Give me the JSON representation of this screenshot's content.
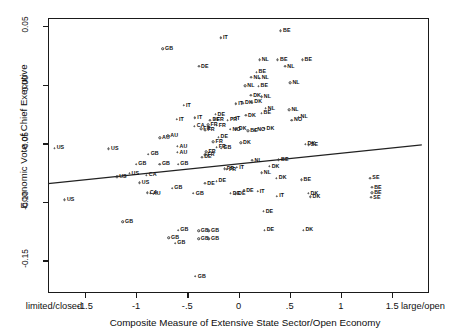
{
  "figure": {
    "kind": "scatter-plot",
    "background": "#ffffff",
    "foreground": "#111111"
  },
  "chart_data": {
    "type": "scatter",
    "title": "",
    "xlabel": "Composite Measure of Extensive State Sector/Open Economy",
    "ylabel": "Economic Vote of Chief Executive",
    "xlim": [
      -1.86,
      1.86
    ],
    "ylim": [
      -0.178,
      0.057
    ],
    "grid": false,
    "legend": null,
    "x_ticks": [
      {
        "value": -1.86,
        "label": "limited/closed",
        "anchor_shift": 6
      },
      {
        "value": -1.5,
        "label": "-1.5"
      },
      {
        "value": -1.0,
        "label": "-1"
      },
      {
        "value": -0.5,
        "label": "-.5"
      },
      {
        "value": 0.0,
        "label": "0"
      },
      {
        "value": 0.5,
        "label": ".5"
      },
      {
        "value": 1.0,
        "label": "1"
      },
      {
        "value": 1.5,
        "label": "1.5"
      },
      {
        "value": 1.86,
        "label": "large/open",
        "anchor_shift": -6
      }
    ],
    "y_ticks": [
      {
        "value": 0.05,
        "label": "0.05"
      },
      {
        "value": 0.0,
        "label": "0.00"
      },
      {
        "value": -0.05,
        "label": "-0.05"
      },
      {
        "value": -0.1,
        "label": "-0.10"
      },
      {
        "value": -0.15,
        "label": "-0.15"
      }
    ],
    "fit_line": {
      "label": "regression-line",
      "x_start": -1.86,
      "y_start": -0.0845,
      "x_end": 1.79,
      "y_end": -0.0515,
      "color": "#222222"
    },
    "point_label_key": "country code",
    "points": [
      {
        "label": "US",
        "x": -1.8,
        "y": -0.0545
      },
      {
        "label": "US",
        "x": -1.27,
        "y": -0.055
      },
      {
        "label": "US",
        "x": -1.07,
        "y": -0.076
      },
      {
        "label": "US",
        "x": -1.19,
        "y": -0.079
      },
      {
        "label": "US",
        "x": -0.97,
        "y": -0.084
      },
      {
        "label": "US",
        "x": -1.7,
        "y": -0.0985
      },
      {
        "label": "GB",
        "x": -0.74,
        "y": 0.0305
      },
      {
        "label": "GB",
        "x": -0.88,
        "y": -0.0595
      },
      {
        "label": "GB",
        "x": -1.0,
        "y": -0.068
      },
      {
        "label": "GB",
        "x": -0.77,
        "y": -0.068
      },
      {
        "label": "GB",
        "x": -0.59,
        "y": -0.068
      },
      {
        "label": "GB",
        "x": -0.65,
        "y": -0.0885
      },
      {
        "label": "GB",
        "x": -0.44,
        "y": -0.093
      },
      {
        "label": "GB",
        "x": -0.17,
        "y": -0.0545
      },
      {
        "label": "GB",
        "x": -1.13,
        "y": -0.1175
      },
      {
        "label": "GB",
        "x": -0.59,
        "y": -0.1245
      },
      {
        "label": "GB",
        "x": -0.68,
        "y": -0.131
      },
      {
        "label": "GB",
        "x": -0.62,
        "y": -0.1355
      },
      {
        "label": "GB",
        "x": -0.39,
        "y": -0.125
      },
      {
        "label": "GB",
        "x": -0.39,
        "y": -0.132
      },
      {
        "label": "GB",
        "x": -0.29,
        "y": -0.125
      },
      {
        "label": "GB",
        "x": -0.29,
        "y": -0.132
      },
      {
        "label": "GB",
        "x": -0.42,
        "y": -0.164
      },
      {
        "label": "AU",
        "x": -0.77,
        "y": -0.0455
      },
      {
        "label": "AU",
        "x": -0.69,
        "y": -0.044
      },
      {
        "label": "AU",
        "x": -0.6,
        "y": -0.053
      },
      {
        "label": "AU",
        "x": -0.6,
        "y": -0.058
      },
      {
        "label": "AU",
        "x": -0.86,
        "y": -0.093
      },
      {
        "label": "CA",
        "x": -0.43,
        "y": -0.0355
      },
      {
        "label": "CA",
        "x": -0.9,
        "y": -0.0775
      },
      {
        "label": "CA",
        "x": -0.89,
        "y": -0.0925
      },
      {
        "label": "DE",
        "x": -0.39,
        "y": 0.0155
      },
      {
        "label": "DE",
        "x": -0.23,
        "y": -0.0255
      },
      {
        "label": "DE",
        "x": -0.28,
        "y": -0.0305
      },
      {
        "label": "DE",
        "x": -0.2,
        "y": -0.045
      },
      {
        "label": "DE",
        "x": -0.36,
        "y": -0.062
      },
      {
        "label": "DE",
        "x": -0.08,
        "y": -0.093
      },
      {
        "label": "DE",
        "x": -0.03,
        "y": -0.0935
      },
      {
        "label": "DE",
        "x": 0.05,
        "y": -0.0905
      },
      {
        "label": "DE",
        "x": 0.25,
        "y": -0.1245
      },
      {
        "label": "DE",
        "x": -0.33,
        "y": -0.0845
      },
      {
        "label": "DE",
        "x": -0.22,
        "y": -0.0825
      },
      {
        "label": "DE",
        "x": 0.24,
        "y": -0.1085
      },
      {
        "label": "FR",
        "x": -0.11,
        "y": -0.0305
      },
      {
        "label": "FR",
        "x": -0.24,
        "y": -0.03
      },
      {
        "label": "FR",
        "x": -0.3,
        "y": -0.0345
      },
      {
        "label": "FR",
        "x": -0.22,
        "y": -0.035
      },
      {
        "label": "FR",
        "x": -0.37,
        "y": -0.038
      },
      {
        "label": "FR",
        "x": -0.33,
        "y": -0.039
      },
      {
        "label": "FR",
        "x": -0.25,
        "y": -0.049
      },
      {
        "label": "FR",
        "x": -0.22,
        "y": -0.0535
      },
      {
        "label": "FR",
        "x": -0.32,
        "y": -0.0575
      },
      {
        "label": "FR",
        "x": -0.33,
        "y": -0.06
      },
      {
        "label": "FR",
        "x": -0.14,
        "y": -0.072
      },
      {
        "label": "FR",
        "x": -0.12,
        "y": -0.0725
      },
      {
        "label": "IT",
        "x": -0.19,
        "y": 0.04
      },
      {
        "label": "IT",
        "x": -0.04,
        "y": -0.0165
      },
      {
        "label": "IT",
        "x": -0.55,
        "y": -0.018
      },
      {
        "label": "IT",
        "x": -0.07,
        "y": -0.029
      },
      {
        "label": "IT",
        "x": -0.62,
        "y": -0.03
      },
      {
        "label": "IT",
        "x": -0.44,
        "y": -0.0285
      },
      {
        "label": "IT",
        "x": -0.03,
        "y": -0.071
      },
      {
        "label": "IT",
        "x": 0.17,
        "y": -0.0915
      },
      {
        "label": "IT",
        "x": 0.36,
        "y": -0.0955
      },
      {
        "label": "NL",
        "x": 0.2,
        "y": 0.021
      },
      {
        "label": "NL",
        "x": 0.45,
        "y": 0.0155
      },
      {
        "label": "NL",
        "x": 0.12,
        "y": 0.006
      },
      {
        "label": "NL",
        "x": 0.2,
        "y": 0.0055
      },
      {
        "label": "NL",
        "x": 0.06,
        "y": -0.001
      },
      {
        "label": "NL",
        "x": 0.5,
        "y": 0.0015
      },
      {
        "label": "NL",
        "x": 0.22,
        "y": -0.0105
      },
      {
        "label": "NL",
        "x": 0.26,
        "y": -0.0205
      },
      {
        "label": "NL",
        "x": 0.49,
        "y": -0.0215
      },
      {
        "label": "NL",
        "x": 0.58,
        "y": -0.028
      },
      {
        "label": "NL",
        "x": 0.13,
        "y": -0.065
      },
      {
        "label": "NL",
        "x": 0.22,
        "y": -0.0755
      },
      {
        "label": "BE",
        "x": 0.41,
        "y": 0.046
      },
      {
        "label": "BE",
        "x": 0.38,
        "y": 0.021
      },
      {
        "label": "BE",
        "x": 0.62,
        "y": 0.021
      },
      {
        "label": "BE",
        "x": 0.17,
        "y": 0.0105
      },
      {
        "label": "BE",
        "x": 0.19,
        "y": -0.0015
      },
      {
        "label": "BE",
        "x": 0.22,
        "y": -0.0245
      },
      {
        "label": "BE",
        "x": 0.09,
        "y": -0.0395
      },
      {
        "label": "BE",
        "x": 0.39,
        "y": -0.0645
      },
      {
        "label": "BE",
        "x": 0.61,
        "y": -0.0815
      },
      {
        "label": "BE",
        "x": 1.3,
        "y": -0.088
      },
      {
        "label": "BE",
        "x": 1.3,
        "y": -0.0925
      },
      {
        "label": "DK",
        "x": 0.12,
        "y": -0.0095
      },
      {
        "label": "DK",
        "x": 0.04,
        "y": -0.016
      },
      {
        "label": "DK",
        "x": 0.13,
        "y": -0.015
      },
      {
        "label": "DK",
        "x": 0.07,
        "y": -0.0265
      },
      {
        "label": "DK",
        "x": -0.02,
        "y": -0.038
      },
      {
        "label": "DK",
        "x": 0.25,
        "y": -0.0375
      },
      {
        "label": "DK",
        "x": 0.02,
        "y": -0.05
      },
      {
        "label": "DK",
        "x": 0.65,
        "y": -0.051
      },
      {
        "label": "DK",
        "x": 0.3,
        "y": -0.07
      },
      {
        "label": "DK",
        "x": 0.37,
        "y": -0.08
      },
      {
        "label": "DK",
        "x": 0.68,
        "y": -0.093
      },
      {
        "label": "DK",
        "x": 0.7,
        "y": -0.096
      },
      {
        "label": "DK",
        "x": 0.63,
        "y": -0.1245
      },
      {
        "label": "NO",
        "x": -0.08,
        "y": -0.0385
      },
      {
        "label": "NO",
        "x": 0.16,
        "y": -0.039
      },
      {
        "label": "NO",
        "x": 0.52,
        "y": -0.0305
      },
      {
        "label": "SE",
        "x": 1.28,
        "y": -0.08
      },
      {
        "label": "SE",
        "x": 1.29,
        "y": -0.0965
      },
      {
        "label": "SE",
        "x": 0.68,
        "y": -0.0515
      }
    ]
  }
}
